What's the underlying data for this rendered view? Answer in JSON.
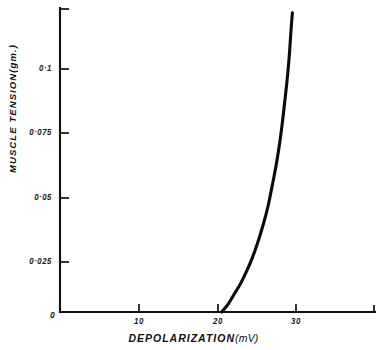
{
  "chart_data": {
    "type": "line",
    "title": "",
    "xlabel": "DEPOLARIZATION",
    "xunit": "(mV)",
    "ylabel": "MUSCLE TENSION",
    "yunit": "(gm.)",
    "origin_label": "0",
    "xlim": [
      0,
      40
    ],
    "ylim": [
      0,
      0.122
    ],
    "grid": false,
    "legend": "none",
    "xticks": [
      {
        "value": 10,
        "label": "10"
      },
      {
        "value": 20,
        "label": "20"
      },
      {
        "value": 30,
        "label": "30"
      }
    ],
    "yticks": [
      {
        "value": 0.025,
        "label": "0·025"
      },
      {
        "value": 0.05,
        "label": "0·05"
      },
      {
        "value": 0.075,
        "label": "0·075"
      },
      {
        "value": 0.1,
        "label": "0·1"
      }
    ],
    "series": [
      {
        "name": "tension-depolarization",
        "color": "#0b0b0b",
        "x": [
          20.6,
          21.4,
          22.2,
          23.0,
          23.8,
          24.5,
          25.2,
          25.9,
          26.5,
          27.1,
          27.6,
          28.1,
          28.5,
          28.9,
          29.2,
          29.4,
          29.6
        ],
        "y": [
          0.0,
          0.003,
          0.007,
          0.011,
          0.016,
          0.021,
          0.027,
          0.034,
          0.041,
          0.05,
          0.058,
          0.068,
          0.078,
          0.089,
          0.099,
          0.108,
          0.116
        ]
      }
    ]
  },
  "axes_px": {
    "x0": 60,
    "y0": 312,
    "x_right": 375,
    "y_top": 8,
    "px_per_mv": 7.85,
    "px_per_unit_y": 2580
  }
}
